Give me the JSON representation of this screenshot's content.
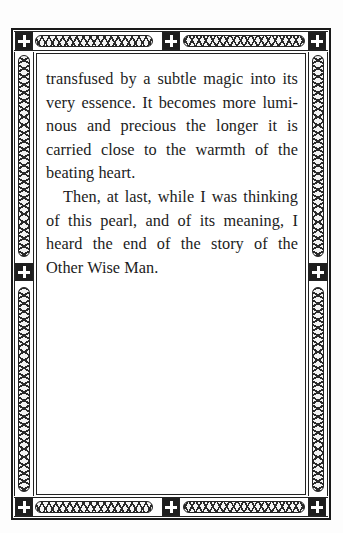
{
  "page": {
    "background": "#ffffff",
    "ink_color": "#1c1c1c"
  },
  "border": {
    "style": "ornamental-interlace",
    "corner_ornament": "cross-icon",
    "top_band": [
      "cross",
      "lattice",
      "cross",
      "lattice",
      "cross"
    ],
    "side_band": [
      "interlace",
      "cross",
      "interlace"
    ],
    "bottom_band": [
      "cross",
      "lattice",
      "cross",
      "lattice",
      "cross"
    ]
  },
  "body": {
    "paragraphs": [
      {
        "continued": true,
        "lines": [
          "transfused by a subtle magic into its",
          "very essence. It becomes more lumi-",
          "nous and precious the longer it is",
          "carried close to the warmth of the",
          "beating heart."
        ]
      },
      {
        "continued": false,
        "lines": [
          "Then, at last, while I was thinking",
          "of this pearl, and of its meaning, I",
          "heard the end of the story of the",
          "Other Wise Man."
        ]
      }
    ]
  }
}
